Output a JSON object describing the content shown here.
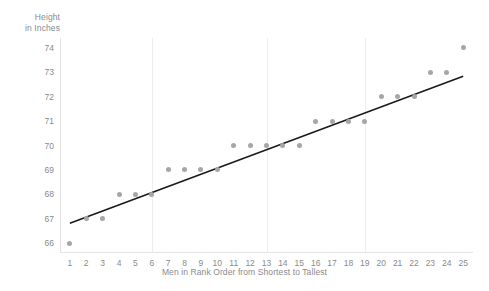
{
  "chart_data": {
    "type": "scatter",
    "title": "",
    "xlabel": "Men in Rank Order from Shortest to Tallest",
    "ylabel": "Height\nin Inches",
    "x": [
      1,
      2,
      3,
      4,
      5,
      6,
      7,
      8,
      9,
      10,
      11,
      12,
      13,
      14,
      15,
      16,
      17,
      18,
      19,
      20,
      21,
      22,
      23,
      24,
      25
    ],
    "values": [
      66,
      67,
      67,
      68,
      68,
      68,
      69,
      69,
      69,
      69,
      70,
      70,
      70,
      70,
      70,
      71,
      71,
      71,
      71,
      72,
      72,
      72,
      73,
      73,
      74
    ],
    "xlim": [
      0.4,
      25.6
    ],
    "ylim": [
      65.6,
      74.4
    ],
    "xticks": [
      "1",
      "2",
      "3",
      "4",
      "5",
      "6",
      "7",
      "8",
      "9",
      "10",
      "11",
      "12",
      "13",
      "14",
      "15",
      "16",
      "17",
      "18",
      "19",
      "20",
      "21",
      "22",
      "23",
      "24",
      "25"
    ],
    "yticks": [
      "66",
      "67",
      "68",
      "69",
      "70",
      "71",
      "72",
      "73",
      "74"
    ],
    "grid": "vertical-only",
    "gridline_x_positions": [
      6,
      13,
      19
    ],
    "legend": "none",
    "trendline": {
      "type": "linear",
      "x_start": 1,
      "y_start": 66.82,
      "x_end": 25,
      "y_end": 72.83,
      "color": "#1a1a1a"
    },
    "colors": {
      "point": "#a6a6a6",
      "axis_text": "#8a8a8a",
      "gridline": "#ededed",
      "axis_line": "#e2e2e2",
      "background": "#ffffff"
    }
  }
}
